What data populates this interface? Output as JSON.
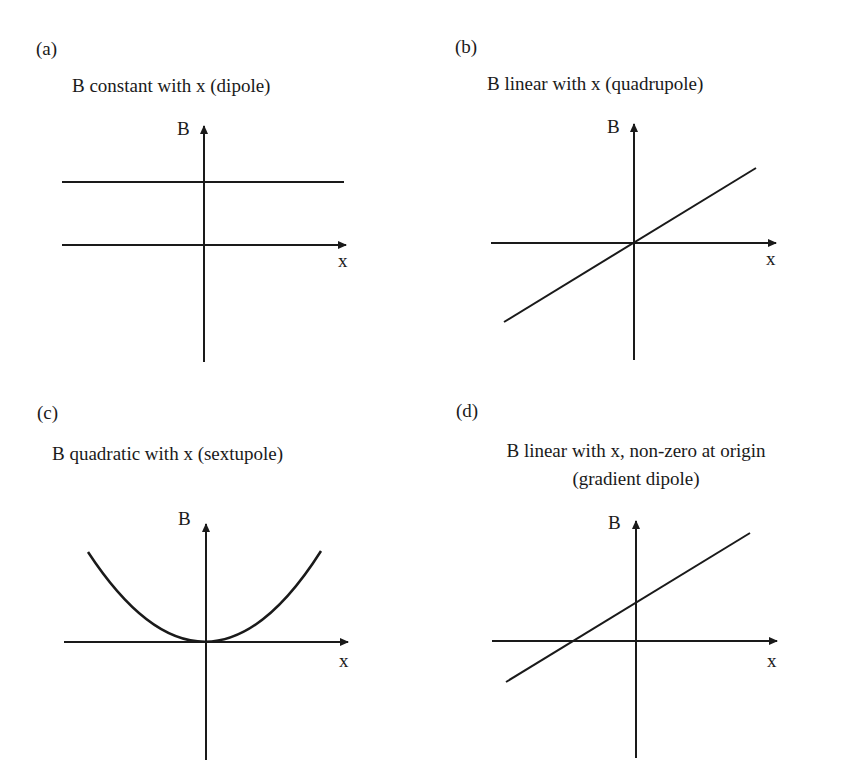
{
  "panels": [
    {
      "id": "a",
      "label": "(a)",
      "title": "B constant with x (dipole)",
      "y_axis_label": "B",
      "x_axis_label": "x",
      "curve": "constant"
    },
    {
      "id": "b",
      "label": "(b)",
      "title": "B linear with x (quadrupole)",
      "y_axis_label": "B",
      "x_axis_label": "x",
      "curve": "linear-through-origin"
    },
    {
      "id": "c",
      "label": "(c)",
      "title": "B quadratic with x (sextupole)",
      "y_axis_label": "B",
      "x_axis_label": "x",
      "curve": "quadratic"
    },
    {
      "id": "d",
      "label": "(d)",
      "title_line1": "B linear with x, non-zero at origin",
      "title_line2": "(gradient dipole)",
      "y_axis_label": "B",
      "x_axis_label": "x",
      "curve": "linear-with-offset"
    }
  ],
  "colors": {
    "line": "#1a1a1a",
    "background": "#ffffff"
  }
}
